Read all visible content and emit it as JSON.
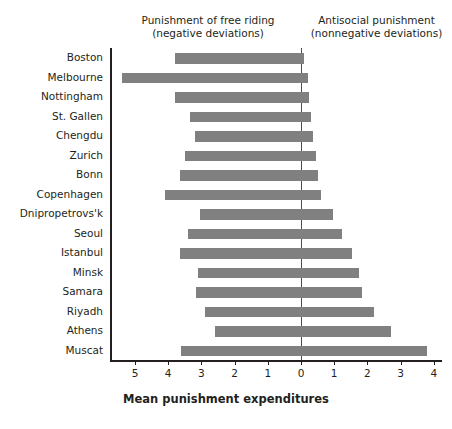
{
  "headers": {
    "left_line1": "Punishment of free riding",
    "left_line2": "(negative deviations)",
    "right_line1": "Antisocial punishment",
    "right_line2": "(nonnegative deviations)"
  },
  "colors": {
    "bar": "#808080",
    "axis": "#231f20",
    "zero_line": "#4d4d4d",
    "background": "#ffffff"
  },
  "chart_data": {
    "type": "bar",
    "orientation": "horizontal",
    "title": "",
    "subtitle": "",
    "xlabel": "Mean punishment expenditures",
    "ylabel": "",
    "grid": false,
    "legend": false,
    "xlim": [
      -5.75,
      4.3
    ],
    "xticks": [
      -5,
      -4,
      -3,
      -2,
      -1,
      0,
      1,
      2,
      3,
      4
    ],
    "xtick_labels": [
      "5",
      "4",
      "3",
      "2",
      "1",
      "0",
      "1",
      "2",
      "3",
      "4"
    ],
    "zero_reference": 0,
    "categories": [
      "Boston",
      "Melbourne",
      "Nottingham",
      "St. Gallen",
      "Chengdu",
      "Zurich",
      "Bonn",
      "Copenhagen",
      "Dnipropetrovs'k",
      "Seoul",
      "Istanbul",
      "Minsk",
      "Samara",
      "Riyadh",
      "Athens",
      "Muscat"
    ],
    "series": [
      {
        "name": "Punishment of free riding (negative deviations)",
        "values": [
          -3.8,
          -5.4,
          -3.8,
          -3.35,
          -3.2,
          -3.5,
          -3.65,
          -4.1,
          -3.05,
          -3.4,
          -3.65,
          -3.1,
          -3.15,
          -2.9,
          -2.6,
          -3.6
        ]
      },
      {
        "name": "Antisocial punishment (nonnegative deviations)",
        "values": [
          0.1,
          0.2,
          0.25,
          0.3,
          0.35,
          0.45,
          0.5,
          0.6,
          0.95,
          1.25,
          1.55,
          1.75,
          1.85,
          2.2,
          2.7,
          3.8
        ]
      }
    ]
  }
}
